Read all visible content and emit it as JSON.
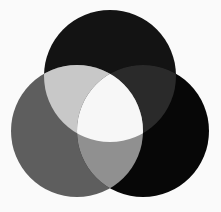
{
  "figure": {
    "name": "three-circle-venn-diagram",
    "title": "",
    "background_color": "#fafafa",
    "width": 221,
    "height": 212
  },
  "chart_data": {
    "type": "venn",
    "title": "",
    "subtitle": "",
    "xlabel": "",
    "ylabel": "",
    "grid": false,
    "legend": "none",
    "annotations": [],
    "set_count": 3,
    "blend_mode": "additive-lighten",
    "sets": [
      {
        "id": "top",
        "label": "",
        "center_x": 110,
        "center_y": 76,
        "radius": 66,
        "base_color": "#0d0d0d"
      },
      {
        "id": "left",
        "label": "",
        "center_x": 77,
        "center_y": 131,
        "radius": 66,
        "base_color": "#5e5e5e"
      },
      {
        "id": "right",
        "label": "",
        "center_x": 143,
        "center_y": 131,
        "radius": 66,
        "base_color": "#070707"
      }
    ],
    "regions": [
      {
        "id": "top-only",
        "sets": [
          "top"
        ],
        "color": "#131313",
        "label": ""
      },
      {
        "id": "left-only",
        "sets": [
          "left"
        ],
        "color": "#5e5e5e",
        "label": ""
      },
      {
        "id": "right-only",
        "sets": [
          "right"
        ],
        "color": "#070707",
        "label": ""
      },
      {
        "id": "top-left",
        "sets": [
          "top",
          "left"
        ],
        "color": "#c8c8c8",
        "label": ""
      },
      {
        "id": "top-right",
        "sets": [
          "top",
          "right"
        ],
        "color": "#2a2a2a",
        "label": ""
      },
      {
        "id": "left-right",
        "sets": [
          "left",
          "right"
        ],
        "color": "#909090",
        "label": ""
      },
      {
        "id": "top-left-right",
        "sets": [
          "top",
          "left",
          "right"
        ],
        "color": "#f7f7f7",
        "label": ""
      }
    ]
  }
}
